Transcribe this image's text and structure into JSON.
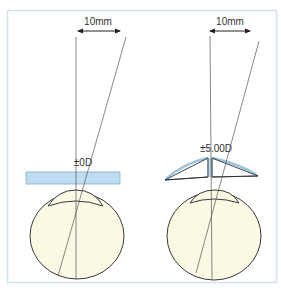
{
  "diagram": {
    "colors": {
      "frame": "#d4e2ec",
      "line": "#555555",
      "eye_fill": "#fbf8e4",
      "eye_stroke": "#3a3a3a",
      "lens_fill": "#bfdcef",
      "lens_stroke": "#7fb0d2",
      "arrow": "#222222",
      "text": "#333333"
    },
    "panels": [
      {
        "id": "left",
        "distance_label": "10mm",
        "power_label": "±0D",
        "lens_type": "flat plate"
      },
      {
        "id": "right",
        "distance_label": "10mm",
        "power_label": "±5.00D",
        "lens_type": "prism pair"
      }
    ]
  }
}
